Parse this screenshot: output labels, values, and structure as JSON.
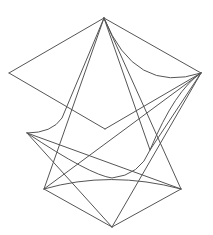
{
  "figure": {
    "type": "wireframe-line-drawing",
    "background": "#ffffff",
    "stroke_color": "#555555",
    "stroke_width": 1,
    "vertices": {
      "top": [
        104,
        18
      ],
      "left": [
        9,
        73
      ],
      "right": [
        201,
        73
      ],
      "center": [
        105,
        129
      ],
      "mid_left": [
        27,
        133
      ],
      "bottom_left": [
        44,
        189
      ],
      "bottom_right": [
        181,
        189
      ],
      "bottom": [
        112,
        227
      ]
    },
    "edges": [
      {
        "id": "top-left",
        "d": "M104 18 L9 73"
      },
      {
        "id": "top-right",
        "d": "M104 18 L201 73"
      },
      {
        "id": "left-center",
        "d": "M9 73 L105 129"
      },
      {
        "id": "center-right",
        "d": "M105 129 L201 73"
      },
      {
        "id": "top-right-curve",
        "d": "M104 18 Q135 95 201 73"
      },
      {
        "id": "top-bottomleft",
        "d": "M104 18 L44 189"
      },
      {
        "id": "top-midleft-curve",
        "d": "M104 18 L62 118 Q52 133 27 133"
      },
      {
        "id": "top-bottomright",
        "d": "M104 18 L181 189"
      },
      {
        "id": "top-bottom",
        "d": "M104 18 L150 150"
      },
      {
        "id": "right-bottomleft",
        "d": "M201 73 L44 189"
      },
      {
        "id": "right-bottom",
        "d": "M201 73 L112 227"
      },
      {
        "id": "right-center-curve",
        "d": "M201 73 Q175 90 150 150 Q140 175 112 178 Q90 175 27 133"
      },
      {
        "id": "midleft-bottomright",
        "d": "M27 133 L181 189"
      },
      {
        "id": "midleft-bottom",
        "d": "M27 133 L112 227"
      },
      {
        "id": "bottomleft-bottomright-curve",
        "d": "M44 189 Q110 170 181 189"
      },
      {
        "id": "bottomleft-bottom",
        "d": "M44 189 L112 227"
      },
      {
        "id": "bottomright-bottom",
        "d": "M181 189 L112 227"
      },
      {
        "id": "right-midright",
        "d": "M201 73 L150 150"
      }
    ]
  }
}
